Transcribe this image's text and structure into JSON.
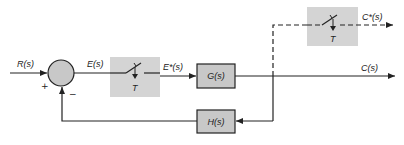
{
  "diagram": {
    "type": "sampled-data closed-loop control system block diagram",
    "colors": {
      "line": "#222222",
      "block_fill": "#c8c8c8",
      "sampler_fill": "#d4d4d4",
      "summer_fill": "#c8c8c8",
      "background": "#ffffff"
    },
    "input_label": "R(s)",
    "summing_junction": {
      "plus_sign": "+",
      "minus_sign": "−"
    },
    "error_label": "E(s)",
    "sampler1": {
      "period_label": "T"
    },
    "sampled_error_label": "E*(s)",
    "forward_block": {
      "label": "G(s)"
    },
    "output_label": "C(s)",
    "feedback_block": {
      "label": "H(s)"
    },
    "sampler2": {
      "period_label": "T"
    },
    "sampled_output_label": "C*(s)"
  }
}
